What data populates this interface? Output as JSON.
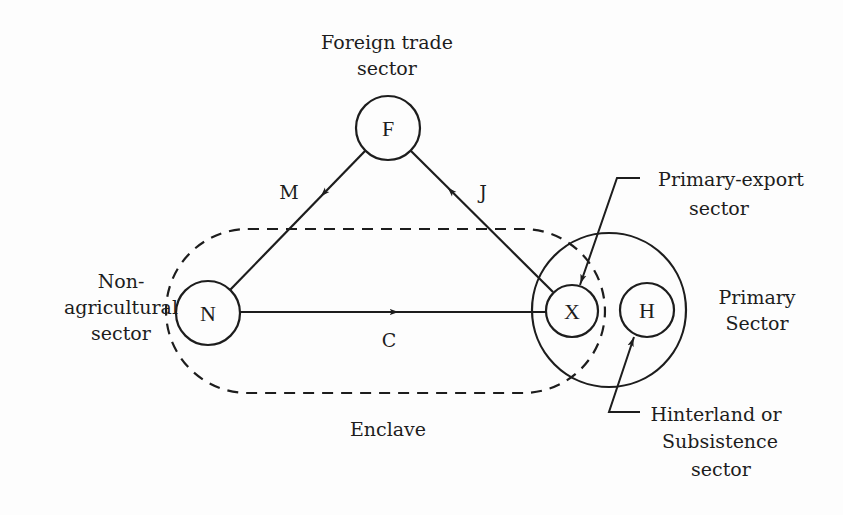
{
  "nodes": {
    "F": {
      "letter": "F",
      "label_line1": "Foreign trade",
      "label_line2": "sector"
    },
    "N": {
      "letter": "N",
      "label_line1": "Non-",
      "label_line2": "agricultural",
      "label_line3": "sector"
    },
    "X": {
      "letter": "X",
      "label_line1": "Primary-export",
      "label_line2": "sector"
    },
    "H": {
      "letter": "H",
      "label_line1": "Hinterland or",
      "label_line2": "Subsistence",
      "label_line3": "sector"
    }
  },
  "edges": {
    "M": {
      "label": "M",
      "from": "F",
      "to": "N"
    },
    "J": {
      "label": "J",
      "from": "X",
      "to": "F"
    },
    "C": {
      "label": "C",
      "from": "N",
      "to": "X"
    }
  },
  "groups": {
    "enclave": {
      "label": "Enclave"
    },
    "primary": {
      "label_line1": "Primary",
      "label_line2": "Sector"
    }
  },
  "colors": {
    "ink": "#1d1d1d",
    "background": "#fdfdfd"
  }
}
